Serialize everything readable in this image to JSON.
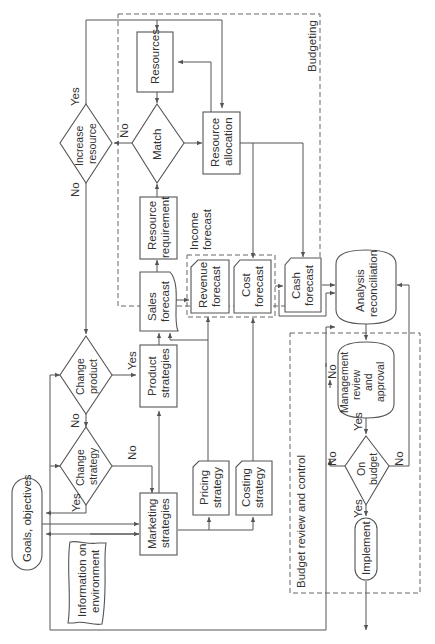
{
  "diagram": {
    "orientation": "rotated-90-ccw",
    "regions": {
      "budgeting": "Budgeting",
      "income_forecast": [
        "Income",
        "forecast"
      ],
      "budget_review": "Budget review and control"
    },
    "nodes": {
      "goals": [
        "Goals, objectives"
      ],
      "information": [
        "Information on",
        "environment"
      ],
      "marketing": [
        "Marketing",
        "strategies"
      ],
      "change_strategy": [
        "Change",
        "strategy"
      ],
      "change_product": [
        "Change",
        "product"
      ],
      "product_strategies": [
        "Product",
        "strategies"
      ],
      "pricing": [
        "Pricing",
        "strategy"
      ],
      "costing": [
        "Costing",
        "strategy"
      ],
      "sales_forecast": [
        "Sales",
        "forecast"
      ],
      "resource_requirement": [
        "Resource",
        "requirement"
      ],
      "revenue_forecast": [
        "Revenue",
        "forecast"
      ],
      "cost_forecast": [
        "Cost",
        "forecast"
      ],
      "cash_forecast": [
        "Cash",
        "forecast"
      ],
      "match": [
        "Match"
      ],
      "resources": [
        "Resources"
      ],
      "resource_allocation": [
        "Resource",
        "allocation"
      ],
      "increase_resource": [
        "Increase",
        "resource"
      ],
      "analysis": [
        "Analysis",
        "reconciliation"
      ],
      "management": [
        "Management",
        "review",
        "and",
        "approval"
      ],
      "on_budget": [
        "On",
        "budget"
      ],
      "implement": [
        "Implement"
      ]
    },
    "edge_labels": {
      "yes": "Yes",
      "no": "No"
    },
    "colors": {
      "line": "#555555",
      "text": "#333333",
      "background": "#ffffff"
    }
  }
}
